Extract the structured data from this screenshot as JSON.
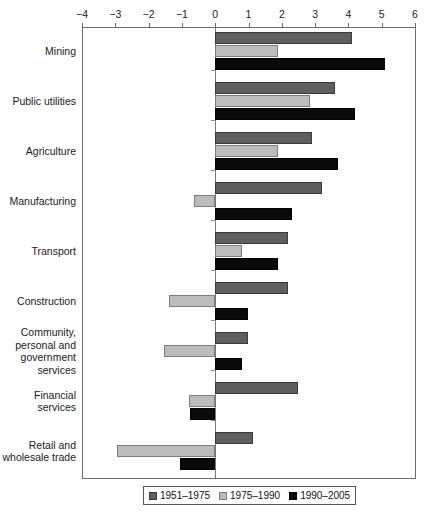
{
  "chart_data": {
    "type": "bar",
    "orientation": "horizontal",
    "title": "",
    "xlabel": "",
    "ylabel": "",
    "xlim": [
      -4,
      6
    ],
    "grid": false,
    "legend_position": "bottom",
    "xticks": [
      -4,
      -3,
      -2,
      -1,
      0,
      1,
      2,
      3,
      4,
      5,
      6
    ],
    "xtick_labels": [
      "−4",
      "−3",
      "−2",
      "−1",
      "0",
      "1",
      "2",
      "3",
      "4",
      "5",
      "6"
    ],
    "categories": [
      "Mining",
      "Public utilities",
      "Agriculture",
      "Manufacturing",
      "Transport",
      "Construction",
      "Community, personal and government services",
      "Financial services",
      "Retail and wholesale trade"
    ],
    "category_label_lines": [
      [
        "Mining"
      ],
      [
        "Public utilities"
      ],
      [
        "Agriculture"
      ],
      [
        "Manufacturing"
      ],
      [
        "Transport"
      ],
      [
        "Construction"
      ],
      [
        "Community,",
        "personal and",
        "government",
        "services"
      ],
      [
        "Financial",
        "services"
      ],
      [
        "Retail and",
        "wholesale trade"
      ]
    ],
    "series": [
      {
        "name": "1951–1975",
        "color": "#5f5f5f",
        "values": [
          4.1,
          3.6,
          2.9,
          3.2,
          2.2,
          2.2,
          1.0,
          2.5,
          1.15
        ]
      },
      {
        "name": "1975–1990",
        "color": "#bcbcbc",
        "values": [
          1.9,
          2.85,
          1.9,
          -0.65,
          0.8,
          -1.4,
          -1.55,
          -0.8,
          -2.95
        ]
      },
      {
        "name": "1990–2005",
        "color": "#0a0a0a",
        "values": [
          5.1,
          4.2,
          3.7,
          2.3,
          1.9,
          1.0,
          0.8,
          -0.75,
          -1.05
        ]
      }
    ]
  },
  "legend": {
    "items": [
      {
        "label": "1951–1975",
        "swatch": "series-0-swatch"
      },
      {
        "label": "1975–1990",
        "swatch": "series-1-swatch"
      },
      {
        "label": "1990–2005",
        "swatch": "series-2-swatch"
      }
    ]
  },
  "colors": {
    "series_0": "#5f5f5f",
    "series_1": "#bcbcbc",
    "series_2": "#0a0a0a",
    "axis": "#6d6d6d",
    "background": "#ffffff"
  }
}
